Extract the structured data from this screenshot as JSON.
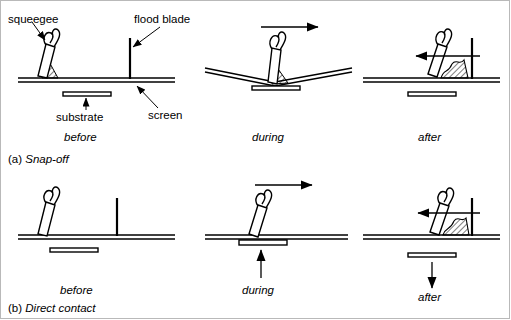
{
  "figure": {
    "background_color": "#ffffff",
    "line_color": "#000000",
    "border_color": "#b9b9b9",
    "width": 511,
    "height": 320
  },
  "callouts": [
    {
      "id": "squeegee",
      "label": "squeegee"
    },
    {
      "id": "flood-blade",
      "label": "flood blade"
    },
    {
      "id": "substrate",
      "label": "substrate"
    },
    {
      "id": "screen",
      "label": "screen"
    }
  ],
  "rows": [
    {
      "id": "snap-off",
      "section_marker": "(a)",
      "section_name": "Snap-off",
      "section_label": "(a) Snap-off",
      "panels": [
        {
          "id": "a-before",
          "stage": "before",
          "squeegee_position": "left",
          "squeegee_tilt": "leaning-right",
          "ink_present": true,
          "screen_state": "flat-raised",
          "substrate_state": "below-screen-gap",
          "motion_arrow": "none"
        },
        {
          "id": "a-during",
          "stage": "during",
          "squeegee_position": "center",
          "squeegee_tilt": "leaning-right",
          "ink_present": true,
          "screen_state": "deflected-contact",
          "substrate_state": "contacted-by-screen",
          "motion_arrow": "right"
        },
        {
          "id": "a-after",
          "stage": "after",
          "squeegee_position": "right",
          "squeegee_tilt": "leaning-right",
          "ink_present": true,
          "screen_state": "flat-raised",
          "substrate_state": "below-screen-gap",
          "motion_arrow": "left"
        }
      ]
    },
    {
      "id": "direct-contact",
      "section_marker": "(b)",
      "section_name": "Direct contact",
      "section_label": "(b) Direct contact",
      "panels": [
        {
          "id": "b-before",
          "stage": "before",
          "squeegee_position": "left",
          "squeegee_tilt": "leaning-right",
          "ink_present": false,
          "screen_state": "flat",
          "substrate_state": "below-screen-gap",
          "motion_arrow": "none"
        },
        {
          "id": "b-during",
          "stage": "during",
          "squeegee_position": "center",
          "squeegee_tilt": "leaning-right",
          "ink_present": false,
          "screen_state": "flat",
          "substrate_state": "raised-to-contact",
          "motion_arrow": "right",
          "substrate_arrow": "up"
        },
        {
          "id": "b-after",
          "stage": "after",
          "squeegee_position": "right",
          "squeegee_tilt": "leaning-right",
          "ink_present": true,
          "screen_state": "flat",
          "substrate_state": "lowered-away",
          "motion_arrow": "left",
          "substrate_arrow": "down"
        }
      ]
    }
  ],
  "stage_labels": {
    "before": "before",
    "during": "during",
    "after": "after"
  }
}
